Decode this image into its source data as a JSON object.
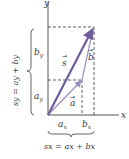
{
  "diagram": {
    "axes": {
      "x_label": "x",
      "y_label": "y"
    },
    "vectors": {
      "a": {
        "label": "a",
        "color": "#9b8fc0"
      },
      "b": {
        "label": "b",
        "color": "#9b8fc0"
      },
      "s": {
        "label": "s",
        "color": "#6f5a9a"
      }
    },
    "components": {
      "ax": "a",
      "ax_sub": "x",
      "bx": "b",
      "bx_sub": "x",
      "ay": "a",
      "ay_sub": "y",
      "by": "b",
      "by_sub": "y"
    },
    "equations": {
      "sx": "sx = ax + bx",
      "sy": "sy = ay + by"
    },
    "colors": {
      "axis": "#555555",
      "dashed": "#333333",
      "brace": "#555555"
    }
  }
}
